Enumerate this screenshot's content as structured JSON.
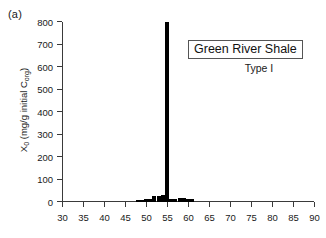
{
  "panel": {
    "label": "(a)"
  },
  "annotations": {
    "title_box": "Green River Shale",
    "kerogen_type": "Type I"
  },
  "axes": {
    "ylabel_main": "X",
    "ylabel_sub": "0",
    "ylabel_rest": " (mg/g initial C",
    "ylabel_sub2": "org",
    "ylabel_close": ")"
  },
  "chart_data": {
    "type": "bar",
    "title": "Green River Shale",
    "subtitle": "Type I",
    "panel_label": "(a)",
    "xlabel": "",
    "ylabel": "X0 (mg/g initial Corg)",
    "xlim": [
      30,
      90
    ],
    "ylim": [
      0,
      800
    ],
    "grid": false,
    "legend_position": "none",
    "bar_color": "#000000",
    "xticks": [
      30,
      35,
      40,
      45,
      50,
      55,
      60,
      65,
      70,
      75,
      80,
      85,
      90
    ],
    "yticks": [
      0,
      100,
      200,
      300,
      400,
      500,
      600,
      700,
      800
    ],
    "bar_width": 1,
    "x": [
      48,
      49,
      50,
      51,
      52,
      53,
      54,
      55,
      56,
      57,
      58,
      59,
      60,
      61
    ],
    "values": [
      8,
      8,
      14,
      14,
      26,
      26,
      32,
      800,
      14,
      14,
      20,
      20,
      14,
      14
    ]
  }
}
